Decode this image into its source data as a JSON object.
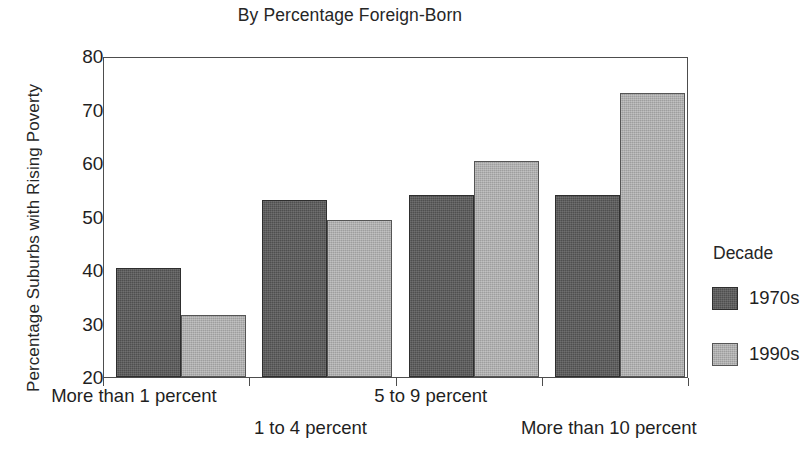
{
  "chart_data": {
    "type": "bar",
    "title": "By Percentage Foreign-Born",
    "xlabel": "",
    "ylabel": "Percentage Suburbs with Rising Poverty",
    "categories": [
      "More than 1 percent",
      "1 to 4 percent",
      "5 to 9 percent",
      "More than 10 percent"
    ],
    "series": [
      {
        "name": "1970s",
        "color": "#4f4f4f",
        "values": [
          40.4,
          53.0,
          54.1,
          54.1
        ]
      },
      {
        "name": "1990s",
        "color": "#9e9e9e",
        "values": [
          31.6,
          49.3,
          60.3,
          73.1
        ]
      }
    ],
    "ylim": [
      20,
      80
    ],
    "ytick_labels": [
      "80",
      "70",
      "60",
      "50",
      "40",
      "30",
      "20"
    ],
    "yticks": [
      80,
      70,
      60,
      50,
      40,
      30,
      20
    ],
    "grid": false,
    "legend": {
      "title": "Decade",
      "position": "right",
      "entries": [
        "1970s",
        "1990s"
      ]
    }
  },
  "legend": {
    "title": "Decade",
    "items": [
      {
        "label": "1970s"
      },
      {
        "label": "1990s"
      }
    ]
  },
  "axes": {
    "y_title": "Percentage Suburbs with Rising Poverty",
    "y_ticks": [
      "80",
      "70",
      "60",
      "50",
      "40",
      "30",
      "20"
    ],
    "x_categories": [
      "More than 1 percent",
      "1 to 4 percent",
      "5 to 9 percent",
      "More than 10 percent"
    ]
  },
  "header": {
    "title": "By Percentage Foreign-Born"
  }
}
